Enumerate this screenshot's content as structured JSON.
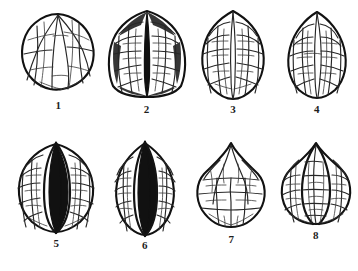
{
  "plate": {
    "title": "Walnut shell morphotypes",
    "background_color": "#ffffff",
    "ink_color": "#111111",
    "columns": 4,
    "rows": 2,
    "specimen_count": 8
  },
  "specimens": [
    {
      "label": "1",
      "row": 1,
      "column": 1,
      "shape": "round",
      "suture": "none",
      "sculpture": "longitudinal-ridged",
      "width_px": 72,
      "height_px": 78
    },
    {
      "label": "2",
      "row": 1,
      "column": 2,
      "shape": "broad-ovate-flat-base",
      "suture": "prominent-dark-central",
      "sculpture": "coarse-reticulate",
      "width_px": 78,
      "height_px": 90
    },
    {
      "label": "3",
      "row": 1,
      "column": 3,
      "shape": "ovate-pointed-apex",
      "suture": "faint-central",
      "sculpture": "fine-reticulate",
      "width_px": 64,
      "height_px": 90
    },
    {
      "label": "4",
      "row": 1,
      "column": 4,
      "shape": "narrow-ovate",
      "suture": "faint-central",
      "sculpture": "fine-reticulate",
      "width_px": 60,
      "height_px": 88
    },
    {
      "label": "5",
      "row": 2,
      "column": 1,
      "shape": "round-apiculate",
      "suture": "very-prominent-dark-keeled",
      "sculpture": "dense-reticulate",
      "width_px": 78,
      "height_px": 92
    },
    {
      "label": "6",
      "row": 2,
      "column": 2,
      "shape": "ovate-acuminate",
      "suture": "very-prominent-dark-keeled",
      "sculpture": "coarse-reticulate",
      "width_px": 62,
      "height_px": 94
    },
    {
      "label": "7",
      "row": 2,
      "column": 3,
      "shape": "cordate-pointed-apex",
      "suture": "none",
      "sculpture": "coarse-angular",
      "width_px": 72,
      "height_px": 86
    },
    {
      "label": "8",
      "row": 2,
      "column": 4,
      "shape": "broad-cordate",
      "suture": "two-longitudinal-ridges",
      "sculpture": "coarse-reticulate",
      "width_px": 74,
      "height_px": 80
    }
  ]
}
